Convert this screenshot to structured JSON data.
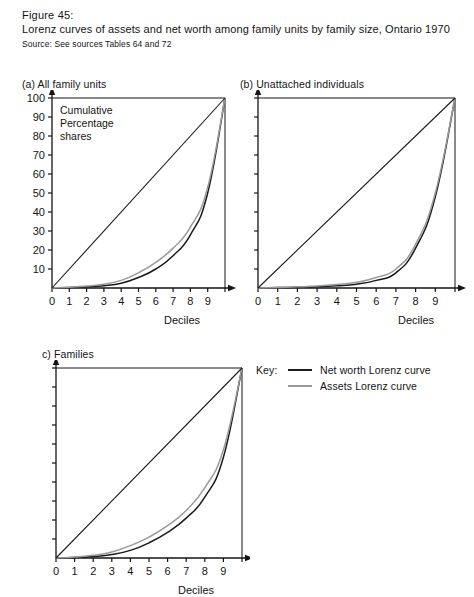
{
  "figure": {
    "number": "Figure 45:",
    "title": "Lorenz curves of assets and net worth among family units by family size, Ontario 1970",
    "source": "Source: See sources Tables 64 and 72"
  },
  "legend": {
    "title": "Key:",
    "items": [
      {
        "label": "Net worth Lorenz curve",
        "color": "#1a1a1a"
      },
      {
        "label": "Assets Lorenz curve",
        "color": "#9a9a9a"
      }
    ]
  },
  "panels": {
    "a": {
      "caption": "(a) All family units",
      "inplot_label_line1": "Cumulative",
      "inplot_label_line2": "Percentage",
      "inplot_label_line3": "shares",
      "xlabel": "Deciles"
    },
    "b": {
      "caption": "(b) Unattached individuals",
      "xlabel": "Deciles"
    },
    "c": {
      "caption": "c) Families",
      "xlabel": "Deciles"
    }
  },
  "chart_data": [
    {
      "id": "a",
      "type": "line",
      "title": "(a) All family units",
      "xlabel": "Deciles",
      "ylabel": "Cumulative Percentage shares",
      "x": [
        0,
        1,
        2,
        3,
        4,
        5,
        6,
        7,
        8,
        9,
        10
      ],
      "xtick_labels": [
        "0",
        "1",
        "2",
        "3",
        "4",
        "5",
        "6",
        "7",
        "8",
        "9"
      ],
      "ytick_labels": [
        "10",
        "20",
        "30",
        "40",
        "50",
        "60",
        "70",
        "80",
        "90",
        "100"
      ],
      "xlim": [
        0,
        10
      ],
      "ylim": [
        0,
        100
      ],
      "grid": false,
      "legend_position": "external-right",
      "series": [
        {
          "name": "Net worth Lorenz curve",
          "color": "#1a1a1a",
          "values": [
            0,
            0.3,
            0.6,
            1.2,
            2.5,
            5.5,
            10.0,
            17.0,
            28.0,
            50.0,
            100
          ]
        },
        {
          "name": "Assets Lorenz curve",
          "color": "#9a9a9a",
          "values": [
            0,
            0.4,
            1.0,
            2.0,
            4.0,
            8.0,
            13.5,
            21.0,
            32.0,
            53.0,
            100
          ]
        },
        {
          "name": "Line of equality",
          "color": "#1a1a1a",
          "values": [
            0,
            10,
            20,
            30,
            40,
            50,
            60,
            70,
            80,
            90,
            100
          ]
        }
      ]
    },
    {
      "id": "b",
      "type": "line",
      "title": "(b) Unattached individuals",
      "xlabel": "Deciles",
      "ylabel": "Cumulative Percentage shares",
      "x": [
        0,
        1,
        2,
        3,
        4,
        5,
        6,
        7,
        8,
        9,
        10
      ],
      "xtick_labels": [
        "0",
        "1",
        "2",
        "3",
        "4",
        "5",
        "6",
        "7",
        "8",
        "9"
      ],
      "ytick_labels": [
        "10",
        "20",
        "30",
        "40",
        "50",
        "60",
        "70",
        "80",
        "90",
        "100"
      ],
      "xlim": [
        0,
        10
      ],
      "ylim": [
        0,
        100
      ],
      "grid": false,
      "legend_position": "external-right",
      "series": [
        {
          "name": "Net worth Lorenz curve",
          "color": "#1a1a1a",
          "values": [
            0,
            0.2,
            0.4,
            0.7,
            1.2,
            2.0,
            4.0,
            8.0,
            21.0,
            48.0,
            100
          ]
        },
        {
          "name": "Assets Lorenz curve",
          "color": "#9a9a9a",
          "values": [
            0,
            0.3,
            0.6,
            1.0,
            1.8,
            3.0,
            5.5,
            10.0,
            23.0,
            50.0,
            100
          ]
        },
        {
          "name": "Line of equality",
          "color": "#1a1a1a",
          "values": [
            0,
            10,
            20,
            30,
            40,
            50,
            60,
            70,
            80,
            90,
            100
          ]
        }
      ]
    },
    {
      "id": "c",
      "type": "line",
      "title": "c) Families",
      "xlabel": "Deciles",
      "ylabel": "Cumulative Percentage shares",
      "x": [
        0,
        1,
        2,
        3,
        4,
        5,
        6,
        7,
        8,
        9,
        10
      ],
      "xtick_labels": [
        "0",
        "1",
        "2",
        "3",
        "4",
        "5",
        "6",
        "7",
        "8",
        "9"
      ],
      "ytick_labels": [
        "10",
        "20",
        "30",
        "40",
        "50",
        "60",
        "70",
        "80",
        "90",
        "100"
      ],
      "xlim": [
        0,
        10
      ],
      "ylim": [
        0,
        100
      ],
      "grid": false,
      "legend_position": "external-right",
      "series": [
        {
          "name": "Net worth Lorenz curve",
          "color": "#1a1a1a",
          "values": [
            0,
            0.3,
            0.8,
            1.8,
            4.0,
            8.0,
            13.5,
            21.0,
            32.0,
            53.0,
            100
          ]
        },
        {
          "name": "Assets Lorenz curve",
          "color": "#9a9a9a",
          "values": [
            0,
            0.5,
            1.4,
            3.2,
            6.5,
            11.0,
            17.0,
            25.0,
            37.0,
            57.0,
            100
          ]
        },
        {
          "name": "Line of equality",
          "color": "#1a1a1a",
          "values": [
            0,
            10,
            20,
            30,
            40,
            50,
            60,
            70,
            80,
            90,
            100
          ]
        }
      ]
    }
  ]
}
